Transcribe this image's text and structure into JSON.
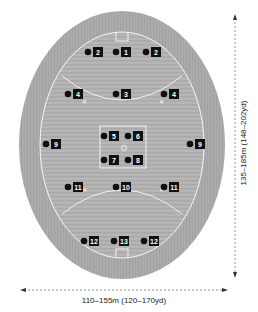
{
  "diagram": {
    "colors": {
      "outer_ground": "#a8a8a8",
      "field": "#b8b8b8",
      "field_stripe": "#adadad",
      "lines": "#ffffff",
      "marker": "#111111"
    },
    "dimensions": {
      "width_label": "110–155m (120–170yd)",
      "length_label": "135–185m (148–202yd)"
    },
    "players": [
      {
        "id": "p1a",
        "number": "2",
        "x": 88,
        "y": 52
      },
      {
        "id": "p1b",
        "number": "1",
        "x": 116,
        "y": 52
      },
      {
        "id": "p1c",
        "number": "2",
        "x": 146,
        "y": 52
      },
      {
        "id": "p2a",
        "number": "4",
        "x": 68,
        "y": 94
      },
      {
        "id": "p2b",
        "number": "3",
        "x": 116,
        "y": 94
      },
      {
        "id": "p2c",
        "number": "4",
        "x": 164,
        "y": 94
      },
      {
        "id": "p3a",
        "number": "5",
        "x": 104,
        "y": 136
      },
      {
        "id": "p3b",
        "number": "6",
        "x": 128,
        "y": 136
      },
      {
        "id": "p3c",
        "number": "9",
        "x": 46,
        "y": 144
      },
      {
        "id": "p3d",
        "number": "9",
        "x": 190,
        "y": 144
      },
      {
        "id": "p3e",
        "number": "7",
        "x": 104,
        "y": 160
      },
      {
        "id": "p3f",
        "number": "8",
        "x": 128,
        "y": 160
      },
      {
        "id": "p4a",
        "number": "11",
        "x": 68,
        "y": 187
      },
      {
        "id": "p4b",
        "number": "10",
        "x": 116,
        "y": 187
      },
      {
        "id": "p4c",
        "number": "11",
        "x": 164,
        "y": 187
      },
      {
        "id": "p5a",
        "number": "12",
        "x": 84,
        "y": 241
      },
      {
        "id": "p5b",
        "number": "13",
        "x": 114,
        "y": 241
      },
      {
        "id": "p5c",
        "number": "12",
        "x": 144,
        "y": 241
      }
    ]
  }
}
